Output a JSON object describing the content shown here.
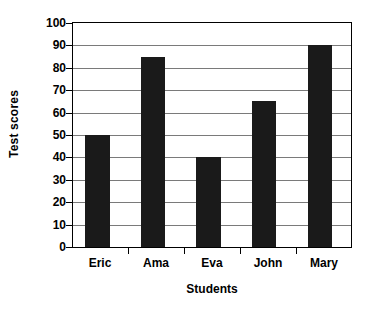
{
  "chart_data": {
    "type": "bar",
    "title": "",
    "subtitle": "",
    "categories": [
      "Eric",
      "Ama",
      "Eva",
      "John",
      "Mary"
    ],
    "values": [
      50,
      85,
      40,
      65,
      90
    ],
    "xlabel": "Students",
    "ylabel": "Test scores",
    "ylim": [
      0,
      100
    ],
    "ytick_step": 10,
    "yticks": [
      0,
      10,
      20,
      30,
      40,
      50,
      60,
      70,
      80,
      90,
      100
    ],
    "ytick_labels": [
      "0",
      "10",
      "20",
      "30",
      "40",
      "50",
      "60",
      "70",
      "80",
      "90",
      "100"
    ],
    "grid": true,
    "grid_axis": "y",
    "legend": false,
    "legend_position": "none",
    "bar_color": "#1a1a1a",
    "grid_color": "#7a7a7a",
    "axis_color": "#000000",
    "background_color": "#ffffff",
    "annotations": []
  }
}
